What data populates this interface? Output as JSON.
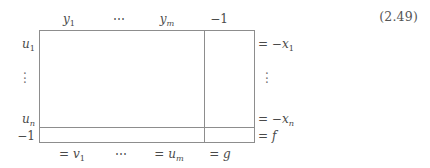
{
  "equation": {
    "number": "(2.49)"
  },
  "tableau": {
    "column_headers": [
      {
        "id": "y1",
        "text": "y",
        "sub": "1",
        "italic": true,
        "sub_italic": false
      },
      {
        "id": "dots",
        "text": "⋯"
      },
      {
        "id": "ym",
        "text": "y",
        "sub": "m",
        "italic": true,
        "sub_italic": true
      },
      {
        "id": "neg1",
        "text": "−1"
      }
    ],
    "column_headers_plain": [
      "y₁",
      "⋯",
      "yₘ",
      "−1"
    ],
    "row_labels_left": [
      {
        "id": "u1",
        "text": "u",
        "sub": "1",
        "italic": true,
        "sub_italic": false
      },
      {
        "id": "un",
        "text": "u",
        "sub": "n",
        "italic": true,
        "sub_italic": true
      },
      {
        "id": "neg1",
        "text": "−1"
      }
    ],
    "row_labels_left_plain": [
      "u₁",
      "uₙ",
      "−1"
    ],
    "row_labels_right": [
      {
        "id": "negx1",
        "prefix": "= −",
        "text": "x",
        "sub": "1",
        "italic": true,
        "sub_italic": false
      },
      {
        "id": "negxn",
        "prefix": "= −",
        "text": "x",
        "sub": "n",
        "italic": true,
        "sub_italic": true
      },
      {
        "id": "f",
        "prefix": "= ",
        "text": "f",
        "sub": "",
        "italic": true,
        "sub_italic": false
      }
    ],
    "row_labels_right_plain": [
      "= −x₁",
      "= −xₙ",
      "= f"
    ],
    "column_footers": [
      {
        "id": "v1",
        "prefix": "= ",
        "text": "v",
        "sub": "1",
        "italic": true,
        "sub_italic": false
      },
      {
        "id": "dots",
        "prefix": "",
        "text": "⋯",
        "sub": ""
      },
      {
        "id": "um",
        "prefix": "= ",
        "text": "u",
        "sub": "m",
        "italic": true,
        "sub_italic": true
      },
      {
        "id": "g",
        "prefix": "= ",
        "text": "g",
        "sub": "",
        "italic": true,
        "sub_italic": false
      }
    ],
    "column_footers_plain": [
      "= v₁",
      "⋯",
      "= uₘ",
      "= g"
    ],
    "vertical_ellipsis_glyph": "·",
    "rule_color": "#8d8d8d",
    "text_color": "#4a4a4a",
    "background": "#ffffff"
  }
}
